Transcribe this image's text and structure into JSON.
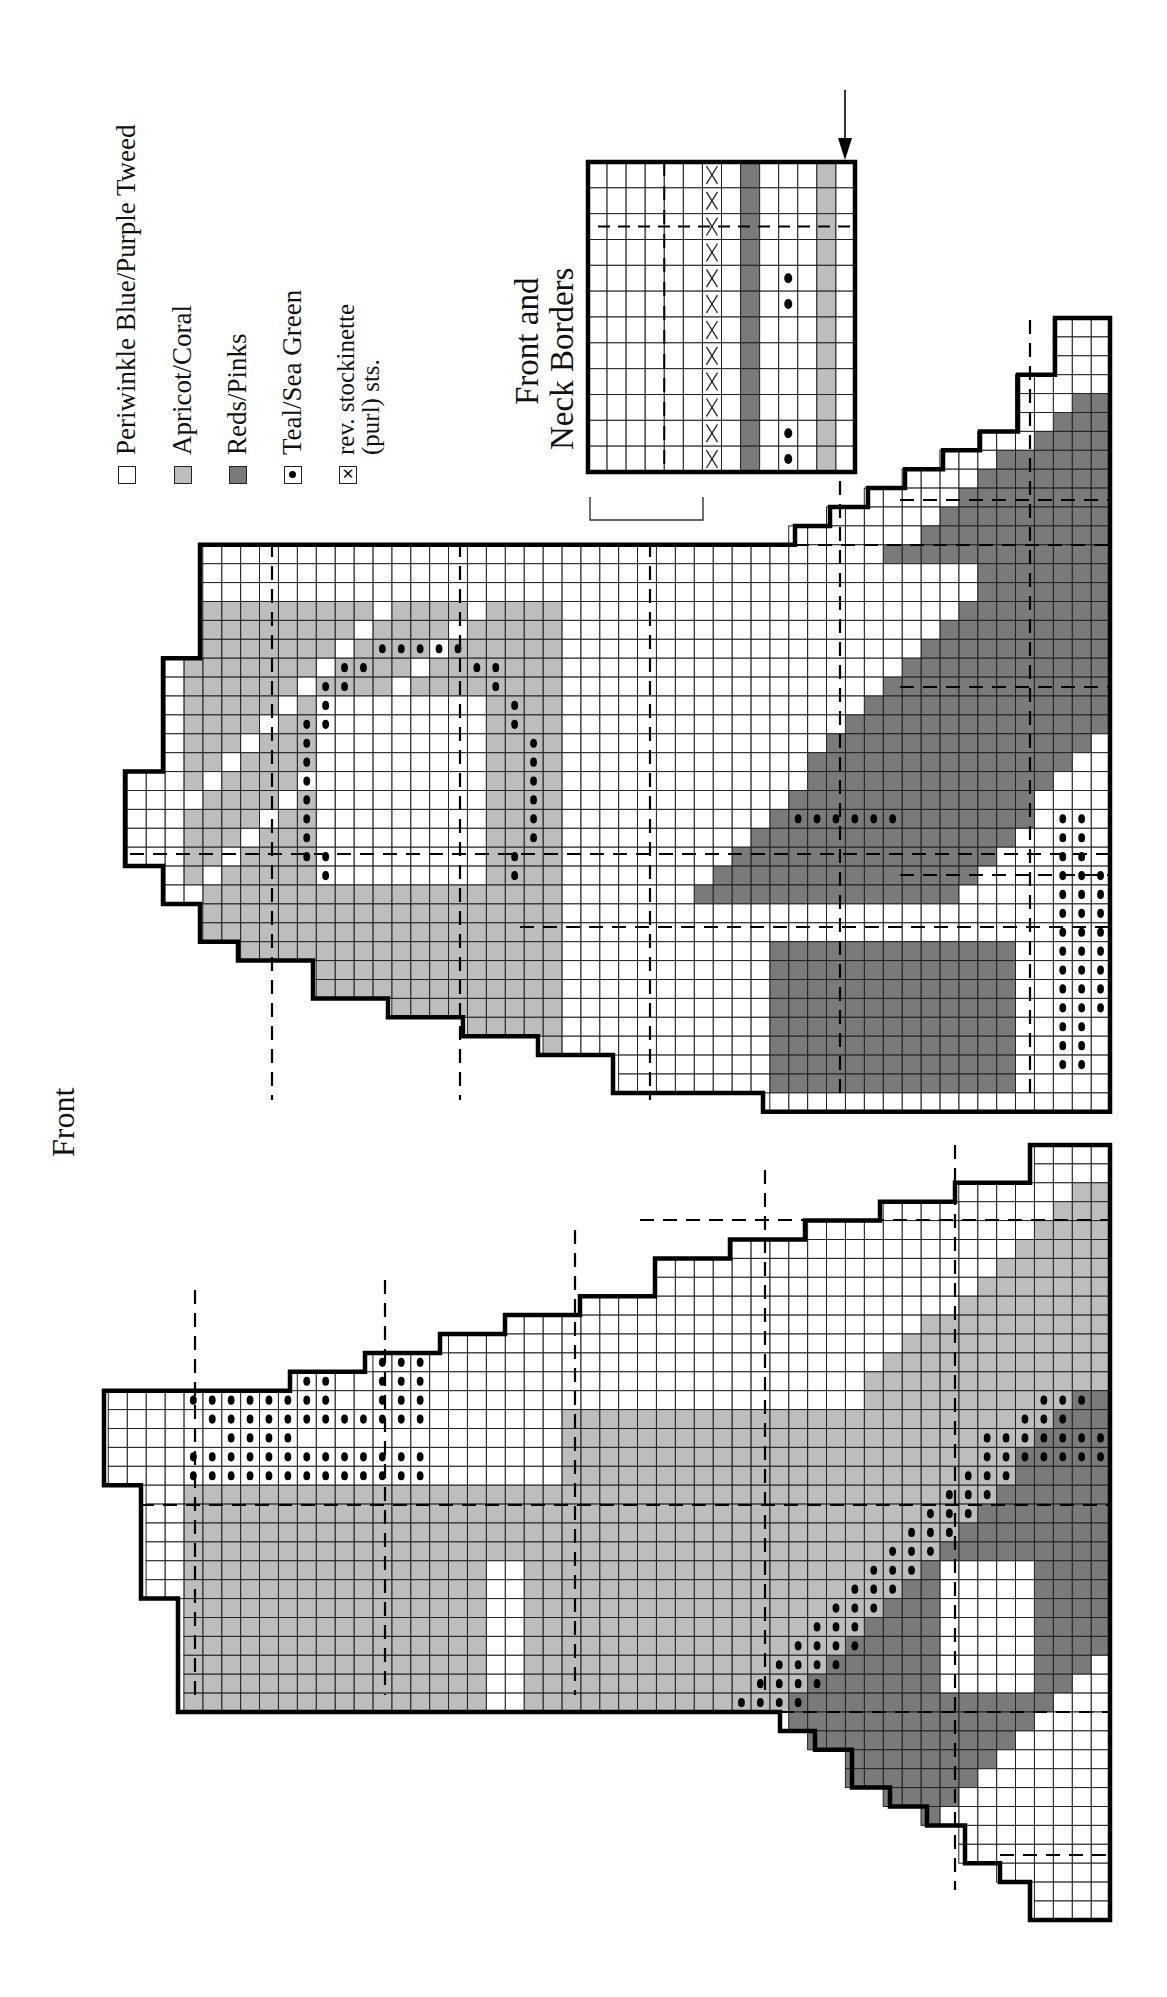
{
  "page": {
    "title": "Front"
  },
  "legend": {
    "items": [
      {
        "symbol": "empty-square",
        "label": "Periwinkle Blue/Purple Tweed",
        "color": "#ffffff"
      },
      {
        "symbol": "light-gray-square",
        "label": "Apricot/Coral",
        "color": "#bdbdbd"
      },
      {
        "symbol": "dark-gray-square",
        "label": "Reds/Pinks",
        "color": "#7a7a7a"
      },
      {
        "symbol": "dot-square",
        "label": "Teal/Sea Green",
        "color": "#ffffff"
      },
      {
        "symbol": "x-square",
        "label_line1": "rev. stockinette",
        "label_line2": "(purl) sts.",
        "color": "#ffffff"
      }
    ]
  },
  "border_chart": {
    "title_line1": "Front and",
    "title_line2": "Neck Borders",
    "rolled_edge_line1": "rolled",
    "rolled_edge_line2": "edge",
    "columns": 14,
    "rows": 12,
    "column_fills": [
      "white",
      "white",
      "white",
      "white",
      "white",
      "white",
      "purl-x",
      "white",
      "reds",
      "white",
      "teal-dots",
      "white",
      "apricot",
      "white"
    ]
  },
  "chart_data": {
    "type": "heatmap",
    "title": "Front",
    "legend": [
      "Periwinkle Blue/Purple Tweed",
      "Apricot/Coral",
      "Reds/Pinks",
      "Teal/Sea Green",
      "rev. stockinette (purl) sts."
    ],
    "cell_size_px": 19,
    "pieces": [
      {
        "name": "upper-front-piece",
        "approx_columns": 52,
        "approx_rows": 42
      },
      {
        "name": "lower-front-piece",
        "approx_columns": 53,
        "approx_rows": 41
      },
      {
        "name": "front-and-neck-borders",
        "columns": 14,
        "rows": 12
      }
    ]
  },
  "colors": {
    "periwinkle": "#ffffff",
    "apricot": "#bdbdbd",
    "reds": "#7a7a7a",
    "outline": "#000000",
    "grid": "#222222"
  }
}
